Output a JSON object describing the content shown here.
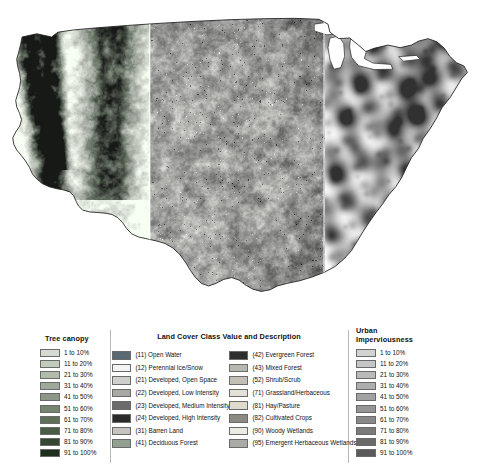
{
  "map": {
    "name": "continental-us-nlcd-composite",
    "description": "Map of the conterminous United States shown as three vertical panels: tree canopy (west), land cover (center), urban imperviousness (east)",
    "panels": [
      {
        "name": "tree-canopy-panel",
        "position": "west"
      },
      {
        "name": "land-cover-panel",
        "position": "center"
      },
      {
        "name": "urban-imperviousness-panel",
        "position": "east"
      }
    ]
  },
  "legends": {
    "tree_canopy": {
      "title": "Tree canopy",
      "items": [
        {
          "label": "1 to 10%",
          "color": "#d5dbd0"
        },
        {
          "label": "11 to 20%",
          "color": "#c3cbbc"
        },
        {
          "label": "21 to 30%",
          "color": "#b2bcaa"
        },
        {
          "label": "31 to 40%",
          "color": "#9ea99a"
        },
        {
          "label": "41 to 50%",
          "color": "#8b9887"
        },
        {
          "label": "51 to 60%",
          "color": "#76856f"
        },
        {
          "label": "61 to 70%",
          "color": "#5f7059"
        },
        {
          "label": "71 to 80%",
          "color": "#495c45"
        },
        {
          "label": "81 to 90%",
          "color": "#354732"
        },
        {
          "label": "91 to 100%",
          "color": "#1f2f1d"
        }
      ]
    },
    "land_cover": {
      "title": "Land Cover Class Value and Description",
      "columns": [
        {
          "name": "land-cover-column-left",
          "items": [
            {
              "label": "(11) Open Water",
              "color": "#5a6a74"
            },
            {
              "label": "(12) Perennial Ice/Snow",
              "color": "#f2f4f4"
            },
            {
              "label": "(21) Developed, Open Space",
              "color": "#cfd0cc"
            },
            {
              "label": "(22) Developed, Low Intensity",
              "color": "#a8a8a5"
            },
            {
              "label": "(23) Developed, Medium Intensity",
              "color": "#6b6b6b"
            },
            {
              "label": "(24) Developed, High Intensity",
              "color": "#2b2b2b"
            },
            {
              "label": "(31) Barren Land",
              "color": "#c6c4bf"
            },
            {
              "label": "(41) Deciduous Forest",
              "color": "#94a08f"
            }
          ]
        },
        {
          "name": "land-cover-column-right",
          "items": [
            {
              "label": "(42) Evergreen Forest",
              "color": "#2e2f2c"
            },
            {
              "label": "(43) Mixed Forest",
              "color": "#b5b8b0"
            },
            {
              "label": "(52) Shrub/Scrub",
              "color": "#c4bfb4"
            },
            {
              "label": "(71) Grassland/Herbaceous",
              "color": "#e3e0d6"
            },
            {
              "label": "(81) Hay/Pasture",
              "color": "#dedbcd"
            },
            {
              "label": "(82) Cultivated Crops",
              "color": "#8c8a82"
            },
            {
              "label": "(90) Woody Wetlands",
              "color": "#eceae3"
            },
            {
              "label": "(95) Emergent Herbaceous Wetlands",
              "color": "#a9aca6"
            }
          ]
        }
      ]
    },
    "urban_imperviousness": {
      "title_line_1": "Urban",
      "title_line_2": "Imperviousness",
      "items": [
        {
          "label": "1 to 10%",
          "color": "#d2d2d2"
        },
        {
          "label": "11 to 20%",
          "color": "#c6c6c6"
        },
        {
          "label": "21 to 30%",
          "color": "#bababa"
        },
        {
          "label": "31 to 40%",
          "color": "#aeaeae"
        },
        {
          "label": "41 to 50%",
          "color": "#a2a2a2"
        },
        {
          "label": "51 to 60%",
          "color": "#959595"
        },
        {
          "label": "61 to 70%",
          "color": "#888888"
        },
        {
          "label": "71 to 80%",
          "color": "#7a7a7a"
        },
        {
          "label": "81 to 90%",
          "color": "#6a6a6a"
        },
        {
          "label": "91 to 100%",
          "color": "#5a5a5a"
        }
      ]
    }
  }
}
